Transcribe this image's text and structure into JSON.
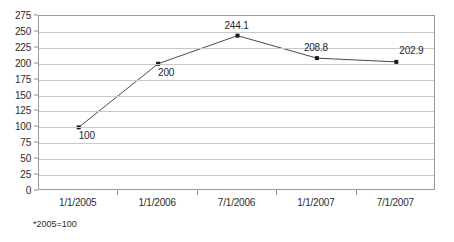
{
  "chart_data": {
    "type": "line",
    "title": "",
    "subtitle": "",
    "xlabel": "",
    "ylabel": "",
    "categories": [
      "1/1/2005",
      "1/1/2006",
      "7/1/2006",
      "1/1/2007",
      "7/1/2007"
    ],
    "values": [
      100,
      200,
      244.1,
      208.8,
      202.9
    ],
    "point_labels": [
      "100",
      "200",
      "244.1",
      "208.8",
      "202.9"
    ],
    "point_label_positions": [
      "below-right",
      "below-right",
      "above",
      "above",
      "above-right"
    ],
    "ylim": [
      0,
      275
    ],
    "ytick_step": 25,
    "ytick_labels": [
      "275",
      "250",
      "225",
      "200",
      "175",
      "150",
      "125",
      "100",
      "75",
      "50",
      "25",
      "0"
    ],
    "grid": true,
    "legend": false,
    "legend_position": "none",
    "series": [
      {
        "name": "Index",
        "values": [
          100,
          200,
          244.1,
          208.8,
          202.9
        ]
      }
    ],
    "annotations": [
      "*2005=100"
    ],
    "colors": {
      "line": "#4a4a4a",
      "marker": "#1a1a1a",
      "gridline": "#c9c9c9",
      "axis": "#8d8d8d",
      "text": "#2b2b2b",
      "background": "#ffffff"
    }
  },
  "footnote": {
    "text": "*2005=100"
  }
}
